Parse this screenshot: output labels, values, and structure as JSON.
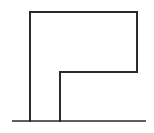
{
  "diagram": {
    "type": "line-drawing",
    "stroke_color": "#2a2a2a",
    "background": "#ffffff",
    "shape": {
      "name": "inverted-L-outline",
      "points": [
        [
          30,
          121
        ],
        [
          30,
          12
        ],
        [
          137,
          12
        ],
        [
          137,
          72
        ],
        [
          60,
          72
        ],
        [
          60,
          121
        ]
      ],
      "stroke_width": 2
    },
    "baseline": {
      "x1": 12,
      "y1": 121,
      "x2": 146,
      "y2": 121,
      "stroke_width": 1.6
    }
  }
}
